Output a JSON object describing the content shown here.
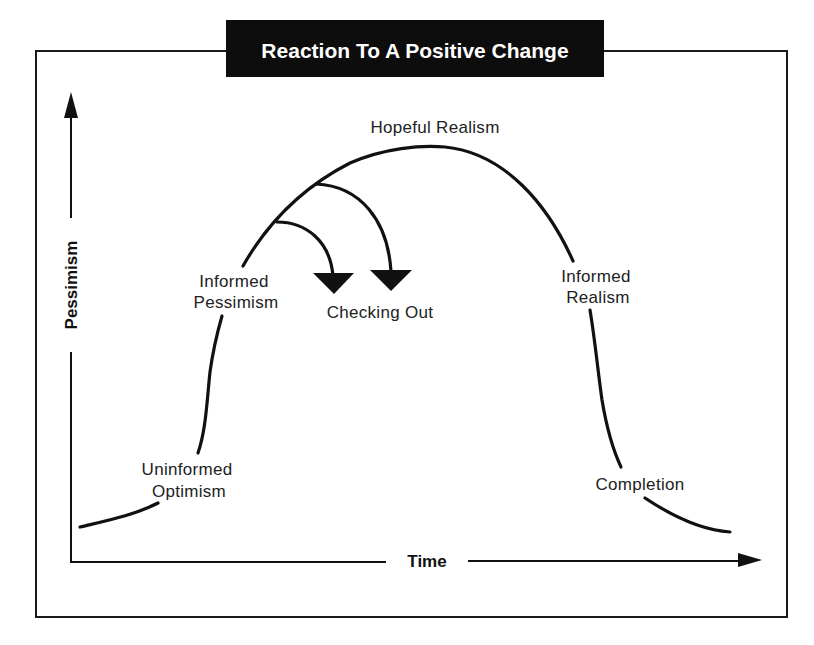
{
  "title": "Reaction To A Positive Change",
  "axes": {
    "y_label": "Pessimism",
    "x_label": "Time"
  },
  "stages": {
    "uninformed_optimism": [
      "Uninformed",
      "Optimism"
    ],
    "informed_pessimism": [
      "Informed",
      "Pessimism"
    ],
    "hopeful_realism": "Hopeful Realism",
    "checking_out": "Checking Out",
    "informed_realism": [
      "Informed",
      "Realism"
    ],
    "completion": "Completion"
  },
  "colors": {
    "ink": "#111111",
    "title_bg": "#0d0d0d",
    "title_text": "#ffffff",
    "background": "#ffffff"
  }
}
